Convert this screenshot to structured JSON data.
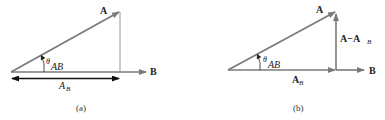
{
  "colors": {
    "vector": "#7a7a7a",
    "projection_arrow": "#111111",
    "text": "#222222",
    "background": "#ffffff"
  },
  "panels": [
    {
      "caption": "(a)",
      "labels": {
        "vector_a": "A",
        "vector_b": "B",
        "angle_symbol": "θ",
        "angle_subscript": "AB",
        "projection_main": "A",
        "projection_sub": "B"
      }
    },
    {
      "caption": "(b)",
      "labels": {
        "vector_a": "A",
        "vector_b": "B",
        "angle_symbol": "θ",
        "angle_subscript": "AB",
        "projection_main": "A",
        "projection_sub": "B",
        "difference_main": "A−A",
        "difference_sub": "B"
      }
    }
  ]
}
